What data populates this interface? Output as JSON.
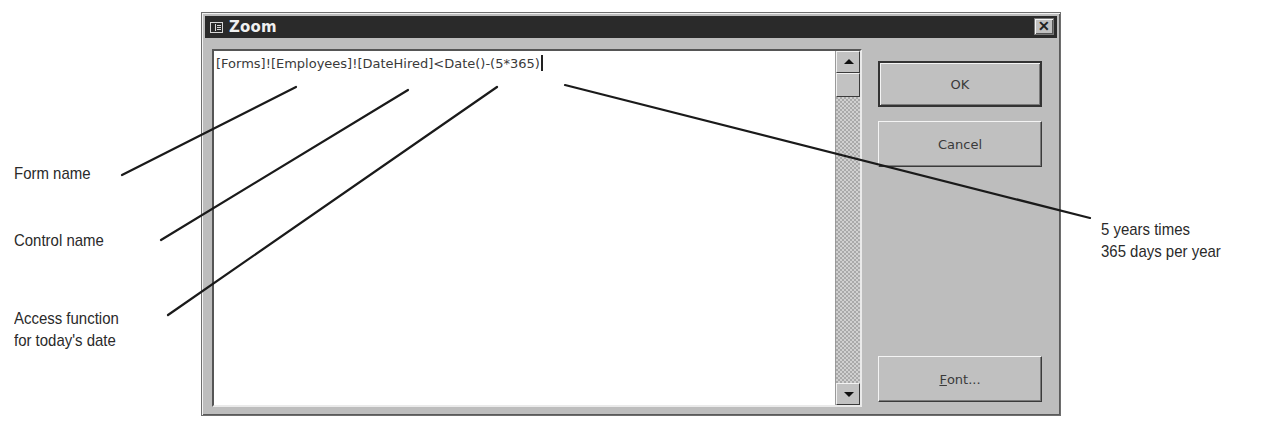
{
  "dialog": {
    "title": "Zoom",
    "title_icon": "form-grid-icon",
    "close_label": "✕",
    "expression": "[Forms]![Employees]![DateHired]<Date()-(5*365)",
    "buttons": {
      "ok": "OK",
      "cancel": "Cancel",
      "font_prefix": "F",
      "font_rest": "ont..."
    }
  },
  "callouts": {
    "form_name": "Form name",
    "control_name": "Control name",
    "access_function_line1": "Access function",
    "access_function_line2": "for today's date",
    "years_line1": "5 years times",
    "years_line2": "365 days per year"
  }
}
